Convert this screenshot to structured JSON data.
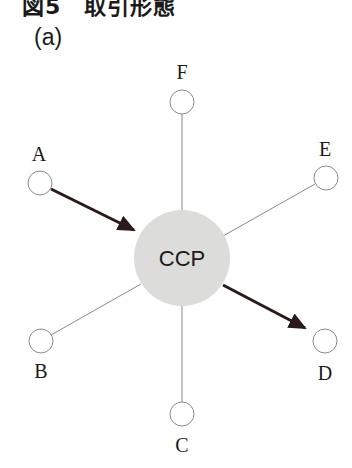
{
  "figure": {
    "title": "図5　取引形態",
    "panel_label": "(a)"
  },
  "diagram": {
    "center": {
      "label": "CCP",
      "fill": "#dcdcda"
    },
    "nodes": [
      {
        "id": "F",
        "label": "F"
      },
      {
        "id": "A",
        "label": "A"
      },
      {
        "id": "E",
        "label": "E"
      },
      {
        "id": "B",
        "label": "B"
      },
      {
        "id": "D",
        "label": "D"
      },
      {
        "id": "C",
        "label": "C"
      }
    ],
    "edges": [
      {
        "from": "A",
        "to": "CCP",
        "style": "arrow"
      },
      {
        "from": "CCP",
        "to": "D",
        "style": "arrow"
      },
      {
        "from": "F",
        "to": "CCP",
        "style": "line"
      },
      {
        "from": "E",
        "to": "CCP",
        "style": "line"
      },
      {
        "from": "B",
        "to": "CCP",
        "style": "line"
      },
      {
        "from": "C",
        "to": "CCP",
        "style": "line"
      }
    ],
    "colors": {
      "arrow": "#2a1a1a",
      "line": "#8a8a8a",
      "node_stroke": "#8a8a8a"
    }
  }
}
